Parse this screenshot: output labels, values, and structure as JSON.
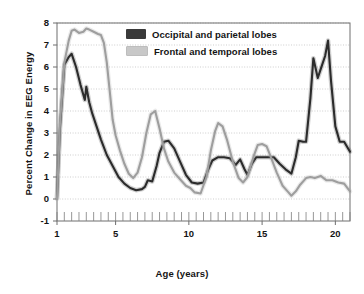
{
  "chart_data": {
    "type": "line",
    "title": "",
    "xlabel": "Age (years)",
    "ylabel": "Percent Change in EEG Energy",
    "xlim": [
      1,
      21
    ],
    "ylim": [
      -1,
      8
    ],
    "xticks": [
      1,
      5,
      10,
      15,
      20
    ],
    "yticks": [
      -1,
      0,
      1,
      2,
      3,
      4,
      5,
      6,
      7,
      8
    ],
    "xminor_tick_step": 0.5,
    "grid": true,
    "grid_axis": "y",
    "legend_position": "top-center",
    "series": [
      {
        "name": "Occipital and parietal lobes",
        "color": "#2b2b2b",
        "x": [
          1.0,
          1.2,
          1.5,
          1.8,
          2.0,
          2.3,
          2.6,
          2.9,
          3.0,
          3.2,
          3.4,
          3.7,
          4.0,
          4.4,
          4.8,
          5.2,
          5.6,
          6.0,
          6.4,
          6.8,
          7.0,
          7.2,
          7.5,
          7.8,
          8.0,
          8.3,
          8.6,
          9.0,
          9.4,
          9.8,
          10.2,
          10.6,
          11.0,
          11.3,
          11.6,
          12.0,
          12.4,
          12.8,
          13.2,
          13.5,
          13.8,
          14.0,
          14.3,
          14.6,
          15.0,
          15.4,
          15.8,
          16.2,
          16.6,
          17.0,
          17.3,
          17.5,
          17.8,
          18.0,
          18.3,
          18.5,
          18.8,
          19.0,
          19.3,
          19.5,
          19.7,
          20.0,
          20.3,
          20.6,
          21.0
        ],
        "y": [
          0.05,
          3.2,
          6.1,
          6.45,
          6.6,
          6.0,
          5.2,
          4.5,
          5.1,
          4.4,
          3.9,
          3.3,
          2.7,
          2.0,
          1.5,
          1.0,
          0.7,
          0.5,
          0.4,
          0.45,
          0.55,
          0.85,
          0.8,
          1.5,
          2.1,
          2.6,
          2.65,
          2.3,
          1.7,
          1.1,
          0.75,
          0.7,
          0.75,
          1.3,
          1.75,
          1.9,
          1.9,
          1.85,
          1.55,
          1.8,
          1.35,
          1.1,
          1.6,
          1.9,
          1.9,
          1.9,
          1.9,
          1.6,
          1.35,
          1.15,
          1.9,
          2.65,
          2.6,
          2.6,
          4.6,
          6.4,
          5.5,
          5.9,
          6.5,
          7.2,
          5.4,
          3.3,
          2.6,
          2.6,
          2.15
        ]
      },
      {
        "name": "Frontal and temporal lobes",
        "color": "#9e9e9e",
        "x": [
          1.0,
          1.2,
          1.5,
          1.8,
          2.0,
          2.2,
          2.5,
          2.8,
          3.0,
          3.2,
          3.5,
          3.8,
          4.0,
          4.2,
          4.4,
          4.6,
          4.8,
          5.0,
          5.3,
          5.6,
          5.9,
          6.2,
          6.5,
          6.8,
          7.1,
          7.4,
          7.7,
          8.0,
          8.3,
          8.6,
          9.0,
          9.4,
          9.8,
          10.1,
          10.4,
          10.8,
          11.2,
          11.5,
          11.8,
          12.0,
          12.3,
          12.6,
          13.0,
          13.4,
          13.7,
          14.0,
          14.4,
          14.7,
          15.0,
          15.3,
          15.6,
          16.0,
          16.4,
          16.8,
          17.0,
          17.3,
          17.6,
          18.0,
          18.3,
          18.6,
          19.0,
          19.4,
          19.8,
          20.2,
          20.6,
          21.0
        ],
        "y": [
          0.0,
          3.4,
          6.2,
          7.2,
          7.65,
          7.7,
          7.55,
          7.6,
          7.75,
          7.7,
          7.6,
          7.5,
          7.45,
          7.1,
          6.2,
          4.9,
          3.6,
          2.9,
          2.2,
          1.6,
          1.15,
          0.95,
          1.2,
          1.9,
          3.0,
          3.85,
          4.0,
          3.2,
          2.3,
          1.7,
          1.2,
          0.9,
          0.6,
          0.5,
          0.3,
          0.25,
          1.0,
          2.2,
          3.1,
          3.45,
          3.3,
          2.7,
          1.7,
          0.95,
          0.75,
          1.0,
          1.9,
          2.45,
          2.5,
          2.4,
          1.9,
          1.2,
          0.6,
          0.3,
          0.15,
          0.35,
          0.65,
          0.95,
          1.0,
          0.95,
          1.05,
          0.85,
          0.85,
          0.75,
          0.7,
          0.35
        ]
      }
    ]
  },
  "legend": {
    "items": [
      {
        "label": "Occipital and parietal lobes",
        "color": "#3a3a3a"
      },
      {
        "label": "Frontal and temporal lobes",
        "color": "#c8c8c8"
      }
    ]
  },
  "axes": {
    "y_title": "Percent Change in EEG Energy",
    "x_title": "Age (years)",
    "y_tick_labels": [
      "8",
      "7",
      "6",
      "5",
      "4",
      "3",
      "2",
      "1",
      "0",
      "-1"
    ],
    "x_tick_labels": [
      "1",
      "5",
      "10",
      "15",
      "20"
    ]
  },
  "colors": {
    "dark_series": "#2b2b2b",
    "light_series": "#9e9e9e",
    "frame": "#6e6e6e",
    "grid": "#b9b9b9",
    "background": "#ffffff",
    "text": "#141414"
  }
}
